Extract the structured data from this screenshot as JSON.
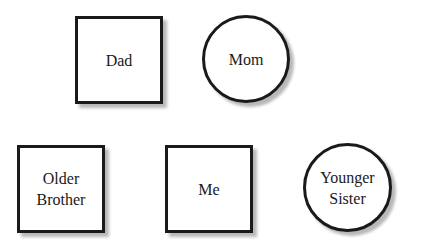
{
  "diagram": {
    "type": "family-tree",
    "nodes": [
      {
        "id": "dad",
        "label": "Dad",
        "shape": "square",
        "gender": "male"
      },
      {
        "id": "mom",
        "label": "Mom",
        "shape": "circle",
        "gender": "female"
      },
      {
        "id": "older_brother",
        "label": "Older\nBrother",
        "shape": "square",
        "gender": "male"
      },
      {
        "id": "me",
        "label": "Me",
        "shape": "square",
        "gender": "male"
      },
      {
        "id": "younger_sister",
        "label": "Younger\nSister",
        "shape": "circle",
        "gender": "female"
      }
    ],
    "colors": {
      "stroke": "#1a1a1a",
      "fill": "#ffffff",
      "shadow": "#b8b8b8"
    }
  }
}
